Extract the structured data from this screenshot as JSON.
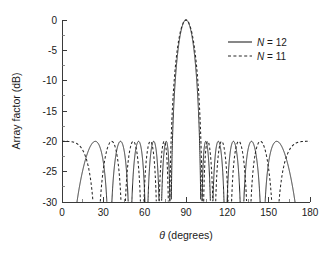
{
  "chart_data": {
    "type": "line",
    "title": "",
    "subtitle": "",
    "xlabel": "θ (degrees)",
    "ylabel": "Array factor (dB)",
    "xlim": [
      0,
      180
    ],
    "ylim": [
      -30,
      0
    ],
    "xticks": [
      0,
      30,
      60,
      90,
      120,
      150,
      180
    ],
    "xticklabels": [
      "0",
      "30",
      "60",
      "90",
      "120",
      "150",
      "180"
    ],
    "yticks": [
      0,
      -5,
      -10,
      -15,
      -20,
      -25,
      -30
    ],
    "yticklabels": [
      "0",
      "-5",
      "-10",
      "-15",
      "-20",
      "-25",
      "-30"
    ],
    "xminor_step": 15,
    "yminor_step": 2.5,
    "grid": false,
    "legend_position": "upper right",
    "sidelobe_level_db": -20,
    "mainlobe_peak_db": 0,
    "mainlobe_peak_deg": 90,
    "mainlobe_null_deg": [
      80,
      100
    ],
    "sidelobe_peaks_deg": [
      23,
      42,
      54,
      66,
      76,
      104,
      114,
      126,
      138,
      157
    ],
    "series": [
      {
        "name": "N = 12",
        "label_prefix": "N",
        "label_value": "12",
        "style": "solid",
        "element_count": 12,
        "color": "#262626"
      },
      {
        "name": "N = 11",
        "label_prefix": "N",
        "label_value": "11",
        "style": "dashed",
        "element_count": 11,
        "color": "#262626"
      }
    ]
  },
  "legend": {
    "entries": [
      {
        "prefix": "N",
        "eq": " = ",
        "value": "12",
        "style": "solid"
      },
      {
        "prefix": "N",
        "eq": " = ",
        "value": "11",
        "style": "dashed"
      }
    ]
  },
  "axes": {
    "x_title_symbol": "θ",
    "x_title_rest": " (degrees)",
    "y_title": "Array factor (dB)"
  }
}
